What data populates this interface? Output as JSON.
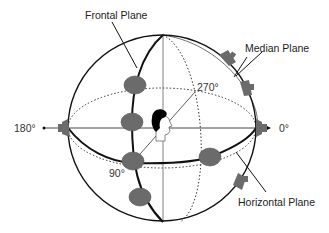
{
  "diagram": {
    "type": "spherical-coordinate-diagram",
    "labels": {
      "frontal_plane": "Frontal Plane",
      "median_plane": "Median Plane",
      "horizontal_plane": "Horizontal Plane"
    },
    "angles": {
      "a0": "0°",
      "a90": "90°",
      "a180": "180°",
      "a270": "270°"
    },
    "colors": {
      "line": "#111111",
      "dotted": "#333333",
      "speaker_fill": "#6b6b6b",
      "speaker_edge": "#4a4a4a",
      "head_hair": "#000000",
      "text": "#222222"
    },
    "speakers": {
      "frontal_plane_count": 4,
      "horizontal_plane_count": 1,
      "median_plane_edge_count": 3,
      "axis_end_count": 2
    }
  }
}
